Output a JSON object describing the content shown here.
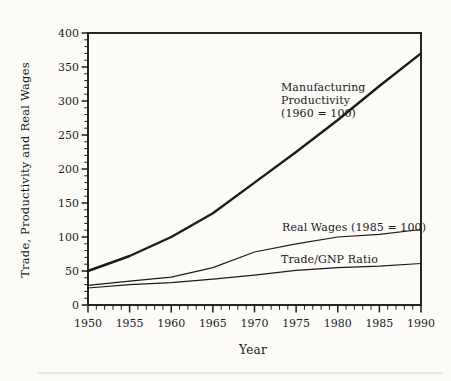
{
  "figure": {
    "background": "#fcfbf8",
    "ink": "#1b1b1b"
  },
  "chart_data": {
    "type": "line",
    "title": "",
    "xlabel": "Year",
    "ylabel": "Trade, Productivity and Real Wages",
    "xlim": [
      1950,
      1990
    ],
    "ylim": [
      0,
      400
    ],
    "x_ticks": [
      1950,
      1955,
      1960,
      1965,
      1970,
      1975,
      1980,
      1985,
      1990
    ],
    "y_ticks": [
      0,
      50,
      100,
      150,
      200,
      250,
      300,
      350,
      400
    ],
    "x_minor_step": 1,
    "y_minor_step": 10,
    "grid": false,
    "legend_position": "inline-annotations",
    "x": [
      1950,
      1955,
      1960,
      1965,
      1970,
      1975,
      1980,
      1985,
      1990
    ],
    "series": [
      {
        "key": "manufacturing_productivity",
        "name": "Manufacturing Productivity (1960 = 100)",
        "values": [
          50,
          72,
          100,
          135,
          180,
          225,
          272,
          322,
          370
        ],
        "thick": true
      },
      {
        "key": "real_wages",
        "name": "Real Wages (1985 = 100)",
        "values": [
          29,
          35,
          41,
          55,
          78,
          90,
          100,
          104,
          111
        ],
        "thick": false
      },
      {
        "key": "trade_gnp_ratio",
        "name": "Trade/GNP Ratio",
        "values": [
          25,
          30,
          33,
          38,
          44,
          51,
          55,
          57,
          61
        ],
        "thick": false
      }
    ],
    "annotations": {
      "manufacturing": "Manufacturing\nProductivity\n(1960 = 100)",
      "real_wages": "Real Wages (1985 = 100)",
      "trade_gnp": "Trade/GNP Ratio"
    }
  }
}
